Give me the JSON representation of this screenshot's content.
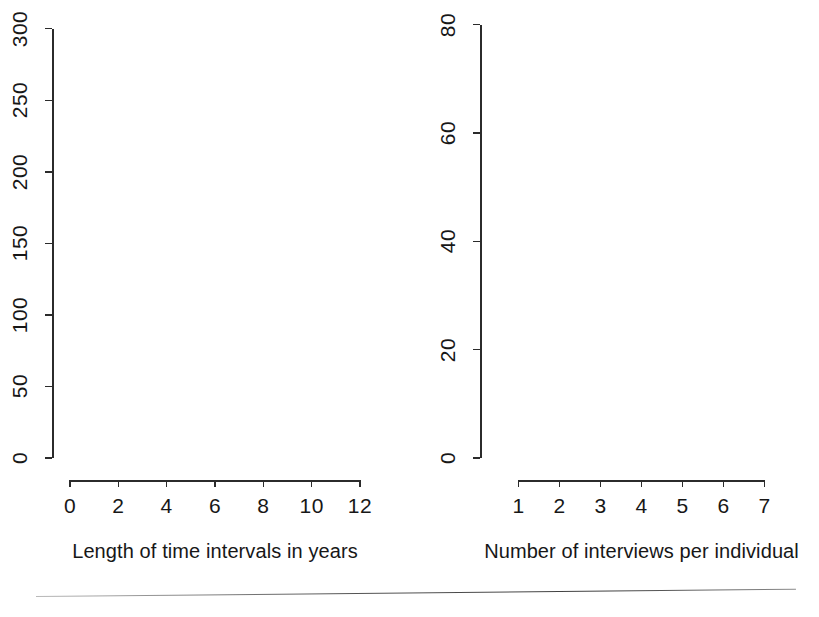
{
  "figure": {
    "background": "#ffffff",
    "bar_fill": "#a8a8a8",
    "bar_stroke": "#2b2b2b",
    "axis_color": "#2b2b2b",
    "panel_count": 2
  },
  "chart_data": [
    {
      "type": "bar",
      "panel": "left",
      "title": "",
      "xlabel": "Length of time intervals in years",
      "ylabel": "",
      "categories": [
        "0-1",
        "1-2",
        "2-3",
        "3-4",
        "4-5",
        "5-6",
        "6-7",
        "7-8",
        "8-9",
        "9-10",
        "10-11",
        "11-12"
      ],
      "bin_edges": [
        0,
        1,
        2,
        3,
        4,
        5,
        6,
        7,
        8,
        9,
        10,
        11,
        12
      ],
      "values": [
        311,
        39,
        35,
        274,
        5,
        0,
        0,
        2,
        0,
        0,
        4,
        1
      ],
      "xlim": [
        0,
        12
      ],
      "ylim": [
        0,
        311
      ],
      "x_ticks": [
        0,
        2,
        4,
        6,
        8,
        10,
        12
      ],
      "x_tick_labels": [
        "0",
        "2",
        "4",
        "6",
        "8",
        "10",
        "12"
      ],
      "y_ticks": [
        0,
        50,
        100,
        150,
        200,
        250,
        300
      ],
      "y_tick_labels": [
        "0",
        "50",
        "100",
        "150",
        "200",
        "250",
        "300"
      ],
      "grid": false,
      "legend": "none"
    },
    {
      "type": "bar",
      "panel": "right",
      "title": "",
      "xlabel": "Number of interviews per individual",
      "ylabel": "",
      "categories": [
        "1",
        "2",
        "3",
        "4",
        "5",
        "6",
        "7"
      ],
      "values": [
        84,
        52,
        18.5,
        19.5,
        7,
        11.5,
        41.5
      ],
      "xlim": [
        0.5,
        7.5
      ],
      "ylim": [
        0,
        84
      ],
      "x_ticks": [
        1,
        2,
        3,
        4,
        5,
        6,
        7
      ],
      "x_tick_labels": [
        "1",
        "2",
        "3",
        "4",
        "5",
        "6",
        "7"
      ],
      "y_ticks": [
        0,
        20,
        40,
        60,
        80
      ],
      "y_tick_labels": [
        "0",
        "20",
        "40",
        "60",
        "80"
      ],
      "grid": false,
      "legend": "none"
    }
  ]
}
